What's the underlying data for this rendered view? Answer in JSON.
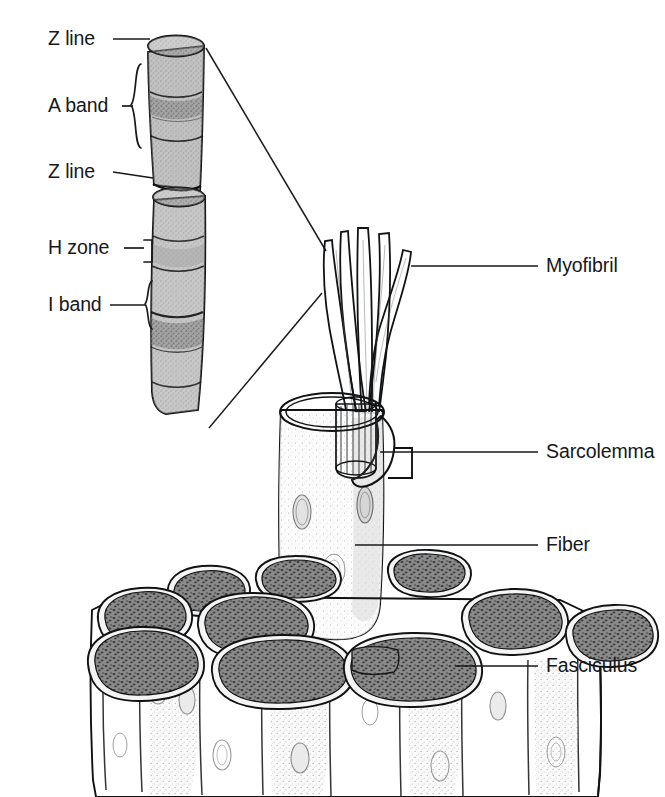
{
  "figure": {
    "background_color": "#ffffff",
    "ink_color": "#17191b"
  },
  "labels": {
    "left": [
      {
        "id": "z-line-top",
        "text": "Z line",
        "x": 48,
        "y": 45,
        "marker": "line"
      },
      {
        "id": "a-band",
        "text": "A band",
        "x": 48,
        "y": 112,
        "marker": "curly-brace"
      },
      {
        "id": "z-line-mid",
        "text": "Z line",
        "x": 48,
        "y": 178,
        "marker": "line"
      },
      {
        "id": "h-zone",
        "text": "H zone",
        "x": 48,
        "y": 254,
        "marker": "square-bracket"
      },
      {
        "id": "i-band",
        "text": "I band",
        "x": 48,
        "y": 311,
        "marker": "curly-brace"
      }
    ],
    "right": [
      {
        "id": "myofibril",
        "text": "Myofibril",
        "x": 546,
        "y": 272
      },
      {
        "id": "sarcolemma",
        "text": "Sarcolemma",
        "x": 546,
        "y": 458
      },
      {
        "id": "fiber",
        "text": "Fiber",
        "x": 546,
        "y": 551
      },
      {
        "id": "fasciculus",
        "text": "Fasciculus",
        "x": 546,
        "y": 672
      }
    ]
  },
  "colors": {
    "myofibril_fill": "#8d8d8d",
    "myofibril_dark": "#6e6e6e",
    "fiber_fill": "#fbfbfb",
    "fiber_shade": "#dedede",
    "cross_section_fill": "#7c7c7c",
    "cross_section_rim": "#f4f4f4",
    "stipple": "#4b4b4b",
    "outline": "#101214"
  },
  "structures": {
    "sarcomere_cylinder": {
      "name": "magnified-myofibril-sarcomeres",
      "segments": 4,
      "description": "Magnified myofibril showing banding pattern"
    },
    "myofibril_bundle": {
      "name": "myofibril-strands",
      "strand_count": 5
    },
    "fiber": {
      "name": "muscle-fiber-cylinder",
      "has_sarcolemma_flap": true,
      "cut_top": true
    },
    "fasciculus": {
      "name": "fasciculus-bundle",
      "fiber_cross_sections": 9
    }
  }
}
